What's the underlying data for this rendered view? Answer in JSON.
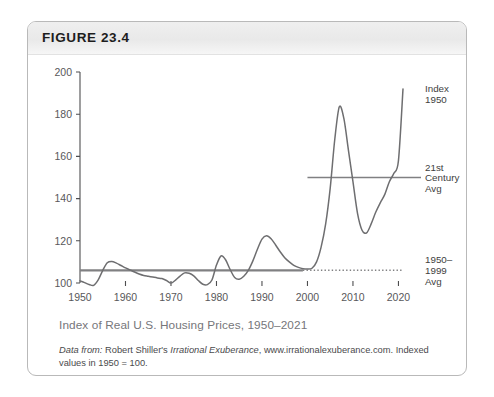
{
  "figure": {
    "number_label": "FIGURE 23.4",
    "caption": "Index of Real U.S. Housing Prices, 1950–2021",
    "source_prefix": "Data from:",
    "source_author": "Robert Shiller's",
    "source_work": "Irrational Exuberance",
    "source_rest": ", www.irrationalexuberance.com. Indexed values in 1950 = 100."
  },
  "colors": {
    "line": "#6e6e70",
    "reference_line": "#808082",
    "axis": "#4d4d4f",
    "tick_text": "#58585a",
    "caption_text": "#76767a",
    "card_border": "#b9b9b9",
    "header_band": "#ececec"
  },
  "chart_data": {
    "type": "line",
    "title": "Index of Real U.S. Housing Prices, 1950–2021",
    "xlabel": "",
    "ylabel": "",
    "xlim": [
      1950,
      2021
    ],
    "ylim": [
      100,
      200
    ],
    "grid": false,
    "legend_position": "right-annotations",
    "y_ticks": [
      100,
      120,
      140,
      160,
      180,
      200
    ],
    "x_ticks": [
      1950,
      1960,
      1970,
      1980,
      1990,
      2000,
      2010,
      2020
    ],
    "series": [
      {
        "name": "Index 1950",
        "style": "solid",
        "x": [
          1950,
          1951,
          1952,
          1953,
          1954,
          1955,
          1956,
          1957,
          1958,
          1959,
          1960,
          1961,
          1962,
          1963,
          1964,
          1965,
          1966,
          1967,
          1968,
          1969,
          1970,
          1971,
          1972,
          1973,
          1974,
          1975,
          1976,
          1977,
          1978,
          1979,
          1980,
          1981,
          1982,
          1983,
          1984,
          1985,
          1986,
          1987,
          1988,
          1989,
          1990,
          1991,
          1992,
          1993,
          1994,
          1995,
          1996,
          1997,
          1998,
          1999,
          2000,
          2001,
          2002,
          2003,
          2004,
          2005,
          2006,
          2007,
          2008,
          2009,
          2010,
          2011,
          2012,
          2013,
          2014,
          2015,
          2016,
          2017,
          2018,
          2019,
          2020,
          2021
        ],
        "y": [
          101.0,
          100.2,
          99.3,
          98.9,
          101.5,
          106.0,
          109.6,
          110.2,
          109.4,
          108.3,
          107.2,
          106.2,
          105.2,
          104.3,
          103.6,
          103.2,
          102.8,
          102.4,
          102.1,
          101.2,
          100.0,
          101.4,
          103.3,
          104.8,
          104.6,
          103.4,
          101.2,
          99.4,
          99.2,
          101.4,
          108.5,
          112.8,
          111.0,
          106.4,
          102.6,
          101.8,
          103.2,
          106.0,
          110.5,
          116.0,
          120.8,
          122.4,
          121.0,
          118.0,
          114.8,
          112.0,
          110.0,
          108.4,
          107.4,
          106.8,
          106.6,
          107.0,
          110.0,
          117.0,
          128.0,
          145.0,
          168.0,
          183.5,
          178.0,
          163.0,
          148.0,
          133.0,
          125.0,
          123.8,
          128.0,
          133.5,
          138.0,
          142.0,
          148.0,
          152.0,
          158.0,
          192.0
        ]
      },
      {
        "name": "1950–1999 Avg",
        "style": "solid-then-dotted",
        "value": 106.0,
        "solid_from": 1950,
        "solid_to": 1999,
        "dotted_from": 1999,
        "dotted_to": 2021
      },
      {
        "name": "21st Century Avg",
        "style": "solid",
        "value": 150.0,
        "from": 2000,
        "to": 2021
      }
    ],
    "annotations": [
      {
        "id": "index-1950",
        "lines": [
          "Index",
          "1950"
        ],
        "at_year": 2021,
        "at_value": 192.0
      },
      {
        "id": "21st-century-avg",
        "lines": [
          "21st",
          "Century",
          "Avg"
        ],
        "at_year": 2021,
        "at_value": 150.0
      },
      {
        "id": "1950-1999-avg",
        "lines": [
          "1950–",
          "1999",
          "Avg"
        ],
        "at_year": 2021,
        "at_value": 106.0
      }
    ]
  }
}
